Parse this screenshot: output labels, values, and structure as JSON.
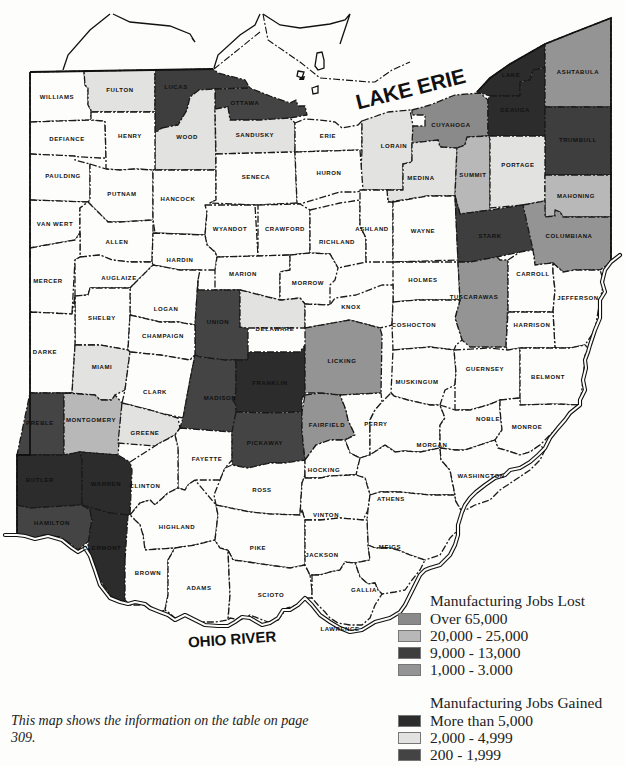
{
  "map": {
    "title": "Ohio manufacturing jobs by county",
    "water_labels": {
      "lake": "LAKE ERIE",
      "river": "OHIO RIVER"
    },
    "colors": {
      "lost_over_65000": "#8a8a8a",
      "lost_20000_25000": "#b8b8b8",
      "lost_9000_13000": "#3e3e3e",
      "lost_1000_3000": "#949494",
      "gained_more_5000": "#2c2c2c",
      "gained_2000_4999": "#e2e2e0",
      "gained_200_1999": "#444444",
      "none": "#fdfdfb"
    },
    "counties": [
      {
        "name": "WILLIAMS",
        "category": "none"
      },
      {
        "name": "FULTON",
        "category": "gained_2000_4999"
      },
      {
        "name": "LUCAS",
        "category": "lost_9000_13000"
      },
      {
        "name": "OTTAWA",
        "category": "gained_200_1999"
      },
      {
        "name": "WOOD",
        "category": "gained_2000_4999"
      },
      {
        "name": "SANDUSKY",
        "category": "gained_2000_4999"
      },
      {
        "name": "ERIE",
        "category": "none"
      },
      {
        "name": "LORAIN",
        "category": "gained_2000_4999"
      },
      {
        "name": "CUYAHOGA",
        "category": "lost_over_65000"
      },
      {
        "name": "LAKE",
        "category": "gained_more_5000"
      },
      {
        "name": "GEAUGA",
        "category": "gained_more_5000"
      },
      {
        "name": "ASHTABULA",
        "category": "lost_1000_3000"
      },
      {
        "name": "TRUMBULL",
        "category": "lost_9000_13000"
      },
      {
        "name": "DEFIANCE",
        "category": "none"
      },
      {
        "name": "HENRY",
        "category": "none"
      },
      {
        "name": "PAULDING",
        "category": "none"
      },
      {
        "name": "PUTNAM",
        "category": "none"
      },
      {
        "name": "HANCOCK",
        "category": "none"
      },
      {
        "name": "SENECA",
        "category": "none"
      },
      {
        "name": "HURON",
        "category": "none"
      },
      {
        "name": "MEDINA",
        "category": "gained_2000_4999"
      },
      {
        "name": "SUMMIT",
        "category": "lost_20000_25000"
      },
      {
        "name": "PORTAGE",
        "category": "gained_2000_4999"
      },
      {
        "name": "MAHONING",
        "category": "lost_20000_25000"
      },
      {
        "name": "VAN WERT",
        "category": "none"
      },
      {
        "name": "ALLEN",
        "category": "none"
      },
      {
        "name": "WYANDOT",
        "category": "none"
      },
      {
        "name": "CRAWFORD",
        "category": "none"
      },
      {
        "name": "RICHLAND",
        "category": "none"
      },
      {
        "name": "ASHLAND",
        "category": "none"
      },
      {
        "name": "WAYNE",
        "category": "none"
      },
      {
        "name": "STARK",
        "category": "lost_9000_13000"
      },
      {
        "name": "COLUMBIANA",
        "category": "lost_1000_3000"
      },
      {
        "name": "HARDIN",
        "category": "none"
      },
      {
        "name": "MERCER",
        "category": "none"
      },
      {
        "name": "AUGLAIZE",
        "category": "none"
      },
      {
        "name": "MARION",
        "category": "none"
      },
      {
        "name": "MORROW",
        "category": "none"
      },
      {
        "name": "HOLMES",
        "category": "none"
      },
      {
        "name": "TUSCARAWAS",
        "category": "lost_1000_3000"
      },
      {
        "name": "CARROLL",
        "category": "none"
      },
      {
        "name": "JEFFERSON",
        "category": "none"
      },
      {
        "name": "LOGAN",
        "category": "none"
      },
      {
        "name": "UNION",
        "category": "gained_200_1999"
      },
      {
        "name": "DELAWARE",
        "category": "gained_2000_4999"
      },
      {
        "name": "KNOX",
        "category": "none"
      },
      {
        "name": "COSHOCTON",
        "category": "none"
      },
      {
        "name": "HARRISON",
        "category": "none"
      },
      {
        "name": "SHELBY",
        "category": "none"
      },
      {
        "name": "DARKE",
        "category": "none"
      },
      {
        "name": "CHAMPAIGN",
        "category": "none"
      },
      {
        "name": "MIAMI",
        "category": "gained_2000_4999"
      },
      {
        "name": "CLARK",
        "category": "none"
      },
      {
        "name": "MADISON",
        "category": "gained_200_1999"
      },
      {
        "name": "FRANKLIN",
        "category": "gained_more_5000"
      },
      {
        "name": "LICKING",
        "category": "lost_1000_3000"
      },
      {
        "name": "MUSKINGUM",
        "category": "none"
      },
      {
        "name": "GUERNSEY",
        "category": "none"
      },
      {
        "name": "BELMONT",
        "category": "none"
      },
      {
        "name": "PREBLE",
        "category": "gained_200_1999"
      },
      {
        "name": "MONTGOMERY",
        "category": "lost_20000_25000"
      },
      {
        "name": "GREENE",
        "category": "gained_2000_4999"
      },
      {
        "name": "FAYETTE",
        "category": "none"
      },
      {
        "name": "PICKAWAY",
        "category": "gained_200_1999"
      },
      {
        "name": "FAIRFIELD",
        "category": "lost_1000_3000"
      },
      {
        "name": "PERRY",
        "category": "none"
      },
      {
        "name": "MORGAN",
        "category": "none"
      },
      {
        "name": "NOBLE",
        "category": "none"
      },
      {
        "name": "MONROE",
        "category": "none"
      },
      {
        "name": "BUTLER",
        "category": "gained_more_5000"
      },
      {
        "name": "WARREN",
        "category": "gained_more_5000"
      },
      {
        "name": "CLINTON",
        "category": "none"
      },
      {
        "name": "ROSS",
        "category": "none"
      },
      {
        "name": "HOCKING",
        "category": "none"
      },
      {
        "name": "ATHENS",
        "category": "none"
      },
      {
        "name": "WASHINGTON",
        "category": "none"
      },
      {
        "name": "HAMILTON",
        "category": "gained_200_1999"
      },
      {
        "name": "CLERMONT",
        "category": "gained_more_5000"
      },
      {
        "name": "HIGHLAND",
        "category": "none"
      },
      {
        "name": "VINTON",
        "category": "none"
      },
      {
        "name": "MEIGS",
        "category": "none"
      },
      {
        "name": "BROWN",
        "category": "none"
      },
      {
        "name": "ADAMS",
        "category": "none"
      },
      {
        "name": "PIKE",
        "category": "none"
      },
      {
        "name": "SCIOTO",
        "category": "none"
      },
      {
        "name": "JACKSON",
        "category": "none"
      },
      {
        "name": "GALLIA",
        "category": "none"
      },
      {
        "name": "LAWRENCE",
        "category": "none"
      }
    ]
  },
  "legend": {
    "lost": {
      "title": "Manufacturing Jobs Lost",
      "items": [
        {
          "label": "Over 65,000",
          "color": "#8a8a8a"
        },
        {
          "label": "20,000 - 25,000",
          "color": "#b8b8b8"
        },
        {
          "label": "9,000 - 13,000",
          "color": "#3e3e3e"
        },
        {
          "label": "1,000 - 3.000",
          "color": "#949494"
        }
      ]
    },
    "gained": {
      "title": "Manufacturing Jobs Gained",
      "items": [
        {
          "label": "More than 5,000",
          "color": "#2c2c2c"
        },
        {
          "label": "2,000 - 4,999",
          "color": "#e2e2e0"
        },
        {
          "label": "200 - 1,999",
          "color": "#444444"
        }
      ]
    }
  },
  "caption": "This map shows the information on the table on page 309."
}
